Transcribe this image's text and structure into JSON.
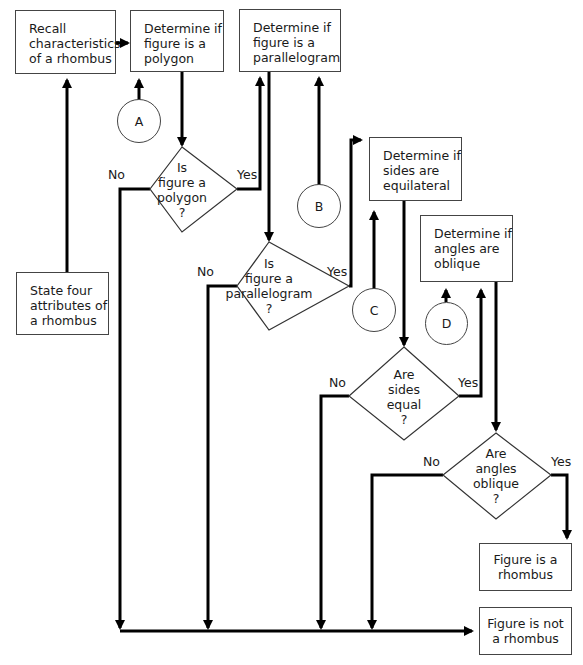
{
  "boxes": {
    "recall": "Recall\ncharacteristics\nof a rhombus",
    "polygon": "Determine if\nfigure is a\npolygon",
    "parallelogram": "Determine if\nfigure is a\nparallelogram",
    "equilateral": "Determine if\nsides are\nequilateral",
    "oblique": "Determine if\nangles are\noblique",
    "state": "State four\nattributes of\na rhombus",
    "is_rhombus": "Figure is a\nrhombus",
    "not_rhombus": "Figure is not\na rhombus"
  },
  "decisions": {
    "polygon": "Is\nfigure a\npolygon\n?",
    "parallelogram": "Is\nfigure a\nparallelogram\n?",
    "sides": "Are\nsides\nequal\n?",
    "angles": "Are\nangles\noblique\n?"
  },
  "labels": {
    "yes": "Yes",
    "no": "No"
  },
  "connectors": {
    "a": "A",
    "b": "B",
    "c": "C",
    "d": "D"
  }
}
